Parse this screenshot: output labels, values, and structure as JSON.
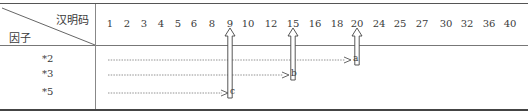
{
  "header": {
    "top_right_label": "汉明码",
    "bottom_left_label": "因子"
  },
  "columns": [
    {
      "label": "1",
      "x": 110
    },
    {
      "label": "2",
      "x": 127
    },
    {
      "label": "3",
      "x": 144
    },
    {
      "label": "4",
      "x": 161
    },
    {
      "label": "5",
      "x": 178
    },
    {
      "label": "6",
      "x": 194
    },
    {
      "label": "8",
      "x": 212
    },
    {
      "label": "9",
      "x": 230
    },
    {
      "label": "10",
      "x": 248
    },
    {
      "label": "12",
      "x": 271
    },
    {
      "label": "15",
      "x": 293
    },
    {
      "label": "16",
      "x": 315
    },
    {
      "label": "18",
      "x": 337
    },
    {
      "label": "20",
      "x": 357
    },
    {
      "label": "24",
      "x": 379
    },
    {
      "label": "25",
      "x": 400
    },
    {
      "label": "27",
      "x": 422
    },
    {
      "label": "30",
      "x": 446
    },
    {
      "label": "32",
      "x": 467
    },
    {
      "label": "36",
      "x": 489
    },
    {
      "label": "40",
      "x": 510
    }
  ],
  "rows": [
    {
      "factor": "*2",
      "y": 60,
      "arrow_end_x": 345,
      "label": "a",
      "target_column": "20"
    },
    {
      "factor": "*3",
      "y": 75,
      "arrow_end_x": 283,
      "label": "b",
      "target_column": "15"
    },
    {
      "factor": "*5",
      "y": 93,
      "arrow_end_x": 222,
      "label": "c",
      "target_column": "9"
    }
  ],
  "colors": {
    "line": "#555555",
    "text": "#3a3a3a"
  }
}
